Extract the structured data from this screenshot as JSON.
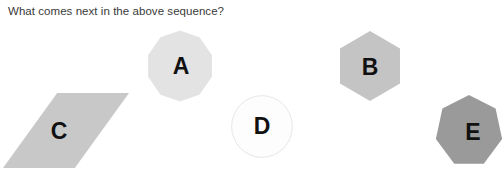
{
  "page": {
    "background_color": "#ffffff",
    "width": 504,
    "height": 182
  },
  "question": {
    "stem": "What comes next in the above sequence?",
    "text_color": "#3a3a3a"
  },
  "options": [
    {
      "letter": "A",
      "shape": "decagon",
      "shape_icon": "decagon-icon",
      "fill_color": "#e3e3e3",
      "stroke_color": "#dcdcdc",
      "label_color": "#111111"
    },
    {
      "letter": "B",
      "shape": "hexagon",
      "shape_icon": "hexagon-icon",
      "fill_color": "#c4c4c4",
      "stroke_color": "#c4c4c4",
      "label_color": "#111111"
    },
    {
      "letter": "C",
      "shape": "parallelogram",
      "shape_icon": "parallelogram-icon",
      "fill_color": "#c8c8c8",
      "stroke_color": "#c8c8c8",
      "label_color": "#111111"
    },
    {
      "letter": "D",
      "shape": "circle",
      "shape_icon": "circle-icon",
      "fill_color": "#fdfdfd",
      "stroke_color": "#e2e2e2",
      "label_color": "#111111"
    },
    {
      "letter": "E",
      "shape": "heptagon",
      "shape_icon": "heptagon-icon",
      "fill_color": "#9a9a9a",
      "stroke_color": "#9a9a9a",
      "label_color": "#111111"
    }
  ]
}
